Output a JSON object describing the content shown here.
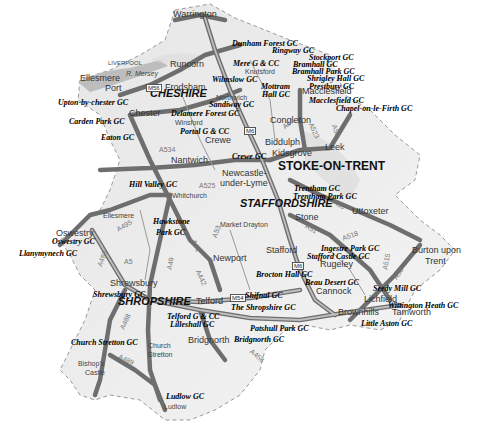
{
  "map": {
    "colors": {
      "land": "#eeeeee",
      "road": "#777777",
      "road_casing": "#555555",
      "border": "#999999",
      "water": "#bbbbbb"
    },
    "counties": [
      {
        "id": "cheshire",
        "label": "CHESHIRE",
        "x": 150,
        "y": 93
      },
      {
        "id": "staffordshire",
        "label": "STAFFORDSHIRE",
        "x": 240,
        "y": 202
      },
      {
        "id": "shropshire",
        "label": "SHROPSHIRE",
        "x": 120,
        "y": 304
      }
    ],
    "cities": [
      {
        "id": "stoke",
        "label": "STOKE-ON-TRENT",
        "x": 285,
        "y": 166
      }
    ],
    "towns": [
      {
        "label": "Warrington",
        "x": 173,
        "y": 15
      },
      {
        "label": "Runcorn",
        "x": 170,
        "y": 64
      },
      {
        "label": "Ellesmere",
        "x": 80,
        "y": 79
      },
      {
        "label": "Port",
        "x": 105,
        "y": 89
      },
      {
        "label": "Frodsham",
        "x": 165,
        "y": 87
      },
      {
        "label": "Knutsford",
        "x": 245,
        "y": 70
      },
      {
        "label": "Northwich",
        "x": 216,
        "y": 98
      },
      {
        "label": "Macclesfield",
        "x": 302,
        "y": 92
      },
      {
        "label": "Chester",
        "x": 131,
        "y": 113
      },
      {
        "label": "Winsford",
        "x": 175,
        "y": 121
      },
      {
        "label": "Congleton",
        "x": 270,
        "y": 121
      },
      {
        "label": "Crewe",
        "x": 205,
        "y": 140
      },
      {
        "label": "Biddulph",
        "x": 265,
        "y": 143
      },
      {
        "label": "Leek",
        "x": 322,
        "y": 147
      },
      {
        "label": "Kidsgrove",
        "x": 272,
        "y": 153
      },
      {
        "label": "Nantwich",
        "x": 172,
        "y": 160
      },
      {
        "label": "Newcastle-",
        "x": 222,
        "y": 173
      },
      {
        "label": "under-Lyme",
        "x": 222,
        "y": 183
      },
      {
        "label": "Whitchurch",
        "x": 172,
        "y": 195
      },
      {
        "label": "Uttoxeter",
        "x": 352,
        "y": 211
      },
      {
        "label": "Stone",
        "x": 295,
        "y": 217
      },
      {
        "label": "Ellesmere",
        "x": 103,
        "y": 214
      },
      {
        "label": "Market Drayton",
        "x": 220,
        "y": 223
      },
      {
        "label": "Oswestry",
        "x": 56,
        "y": 233
      },
      {
        "label": "Stafford",
        "x": 266,
        "y": 250
      },
      {
        "label": "Rugeley",
        "x": 320,
        "y": 263
      },
      {
        "label": "Burton upon",
        "x": 412,
        "y": 250
      },
      {
        "label": "Trent",
        "x": 425,
        "y": 261
      },
      {
        "label": "Newport",
        "x": 213,
        "y": 258
      },
      {
        "label": "Cannock",
        "x": 316,
        "y": 291
      },
      {
        "label": "Lichfield",
        "x": 365,
        "y": 298
      },
      {
        "label": "Shrewsbury",
        "x": 110,
        "y": 283
      },
      {
        "label": "Telford",
        "x": 196,
        "y": 300
      },
      {
        "label": "Tamworth",
        "x": 392,
        "y": 311
      },
      {
        "label": "Brownhills",
        "x": 339,
        "y": 311
      },
      {
        "label": "Bridgnorth",
        "x": 188,
        "y": 340
      },
      {
        "label": "Church",
        "x": 147,
        "y": 344
      },
      {
        "label": "Stretton",
        "x": 148,
        "y": 353
      },
      {
        "label": "Bishop's",
        "x": 79,
        "y": 362
      },
      {
        "label": "Castle",
        "x": 86,
        "y": 371
      },
      {
        "label": "Ludlow",
        "x": 163,
        "y": 404
      }
    ],
    "small_labels": [
      {
        "label": "LIVERPOOL",
        "x": 108,
        "y": 63
      },
      {
        "label": "R. Mersey",
        "x": 128,
        "y": 71
      }
    ],
    "golf_clubs": [
      {
        "label": "Dunham Forest GC",
        "x": 232,
        "y": 43
      },
      {
        "label": "Ringway GC",
        "x": 272,
        "y": 50
      },
      {
        "label": "Stockport GC",
        "x": 309,
        "y": 57
      },
      {
        "label": "Mere G & CC",
        "x": 233,
        "y": 63
      },
      {
        "label": "Bramhall GC",
        "x": 293,
        "y": 64
      },
      {
        "label": "Bramhall Park GC",
        "x": 292,
        "y": 71
      },
      {
        "label": "Shrigley Hall GC",
        "x": 307,
        "y": 78
      },
      {
        "label": "Wilmslow GC",
        "x": 212,
        "y": 79
      },
      {
        "label": "Mottram",
        "x": 261,
        "y": 86
      },
      {
        "label": "Prestbury GC",
        "x": 309,
        "y": 86
      },
      {
        "label": "Hall GC",
        "x": 264,
        "y": 93
      },
      {
        "label": "Sandiway GC",
        "x": 210,
        "y": 104
      },
      {
        "label": "Macclesfield GC",
        "x": 309,
        "y": 100
      },
      {
        "label": "Chapel-on-le-Firth GC",
        "x": 336,
        "y": 108
      },
      {
        "label": "Upton-by-chester GC",
        "x": 58,
        "y": 102
      },
      {
        "label": "Delamere Forest GC",
        "x": 171,
        "y": 113
      },
      {
        "label": "Carden Park GC",
        "x": 69,
        "y": 121
      },
      {
        "label": "Portal G & CC",
        "x": 181,
        "y": 131
      },
      {
        "label": "Eaton GC",
        "x": 101,
        "y": 134
      },
      {
        "label": "Crewe GC",
        "x": 232,
        "y": 155
      },
      {
        "label": "Hill Valley GC",
        "x": 130,
        "y": 183
      },
      {
        "label": "Trentham GC",
        "x": 294,
        "y": 185
      },
      {
        "label": "Trentham Park GC",
        "x": 293,
        "y": 194
      },
      {
        "label": "Hawkstone",
        "x": 154,
        "y": 220
      },
      {
        "label": "Park GC",
        "x": 157,
        "y": 231
      },
      {
        "label": "Oswestry GC",
        "x": 52,
        "y": 239
      },
      {
        "label": "Llanymynech GC",
        "x": 19,
        "y": 251
      },
      {
        "label": "Ingestre Park GC",
        "x": 321,
        "y": 246
      },
      {
        "label": "Stafford Castle GC",
        "x": 307,
        "y": 254
      },
      {
        "label": "Brocton Hall GC",
        "x": 257,
        "y": 271
      },
      {
        "label": "Beau Desert GC",
        "x": 305,
        "y": 279
      },
      {
        "label": "Seedy Mill GC",
        "x": 374,
        "y": 287
      },
      {
        "label": "Wittington Heath GC",
        "x": 388,
        "y": 303
      },
      {
        "label": "Shrewsbury GC",
        "x": 93,
        "y": 292
      },
      {
        "label": "Shifnal GC",
        "x": 244,
        "y": 294
      },
      {
        "label": "The Shropshire GC",
        "x": 231,
        "y": 305
      },
      {
        "label": "Little Aston GC",
        "x": 362,
        "y": 322
      },
      {
        "label": "Telford G & CC",
        "x": 167,
        "y": 314
      },
      {
        "label": "Lilleshall GC",
        "x": 170,
        "y": 322
      },
      {
        "label": "Patshull Park GC",
        "x": 250,
        "y": 325
      },
      {
        "label": "Bridgnorth GC",
        "x": 235,
        "y": 338
      },
      {
        "label": "Church Stretton GC",
        "x": 71,
        "y": 339
      },
      {
        "label": "Ludlow GC",
        "x": 166,
        "y": 394
      }
    ],
    "road_labels": [
      {
        "label": "A534",
        "x": 159,
        "y": 149
      },
      {
        "label": "A525",
        "x": 199,
        "y": 185
      },
      {
        "label": "A53",
        "x": 211,
        "y": 223
      },
      {
        "label": "A495",
        "x": 118,
        "y": 224
      },
      {
        "label": "A5",
        "x": 127,
        "y": 259
      },
      {
        "label": "A49",
        "x": 166,
        "y": 259
      },
      {
        "label": "A41",
        "x": 192,
        "y": 240
      },
      {
        "label": "A442",
        "x": 195,
        "y": 273
      },
      {
        "label": "A50",
        "x": 333,
        "y": 203
      },
      {
        "label": "A51",
        "x": 306,
        "y": 226
      },
      {
        "label": "A518",
        "x": 344,
        "y": 230
      },
      {
        "label": "A515",
        "x": 380,
        "y": 258
      },
      {
        "label": "A38",
        "x": 393,
        "y": 270
      },
      {
        "label": "A523",
        "x": 307,
        "y": 127
      },
      {
        "label": "A53",
        "x": 330,
        "y": 127
      },
      {
        "label": "A54",
        "x": 283,
        "y": 121
      },
      {
        "label": "A488",
        "x": 118,
        "y": 319
      },
      {
        "label": "A489",
        "x": 118,
        "y": 358
      },
      {
        "label": "A458",
        "x": 250,
        "y": 353
      },
      {
        "label": "A483",
        "x": 95,
        "y": 255
      }
    ],
    "motorway_shields": [
      {
        "label": "M56",
        "x": 148,
        "y": 87
      },
      {
        "label": "M6",
        "x": 246,
        "y": 130
      },
      {
        "label": "M6",
        "x": 294,
        "y": 265
      },
      {
        "label": "M54",
        "x": 232,
        "y": 297
      }
    ]
  }
}
